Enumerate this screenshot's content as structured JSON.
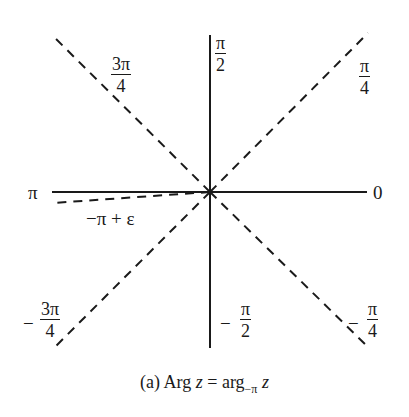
{
  "figure": {
    "caption": {
      "prefix": "(a) Arg ",
      "var1": "z",
      "equals": " = arg",
      "subscript": "−π",
      "var2": "z"
    },
    "origin": {
      "x": 210,
      "y": 192
    },
    "axes": {
      "horizontal": {
        "x1": 52,
        "x2": 367,
        "style": "solid"
      },
      "vertical": {
        "y1": 35,
        "y2": 348,
        "style": "solid"
      }
    },
    "rays": [
      {
        "angle": "π/4",
        "style": "dashed",
        "end": [
          368,
          33
        ]
      },
      {
        "angle": "3π/4",
        "style": "dashed",
        "end": [
          52,
          35
        ]
      },
      {
        "angle": "-3π/4",
        "style": "dashed",
        "end": [
          52,
          350
        ]
      },
      {
        "angle": "-π/4",
        "style": "dashed",
        "end": [
          368,
          347
        ]
      },
      {
        "angle": "-π+ε",
        "style": "dashed",
        "end": [
          53,
          203
        ]
      }
    ],
    "labels": {
      "zero": "0",
      "pi": "π",
      "pi_half": {
        "num": "π",
        "den": "2"
      },
      "pi_quarter": {
        "num": "π",
        "den": "4"
      },
      "three_pi_quarter": {
        "num": "3π",
        "den": "4"
      },
      "neg_three_pi_quarter": {
        "sign": "−",
        "num": "3π",
        "den": "4"
      },
      "neg_pi_half": {
        "sign": "−",
        "num": "π",
        "den": "2"
      },
      "neg_pi_quarter": {
        "sign": "−",
        "num": "π",
        "den": "4"
      },
      "neg_pi_plus_eps": "−π + ε"
    }
  }
}
